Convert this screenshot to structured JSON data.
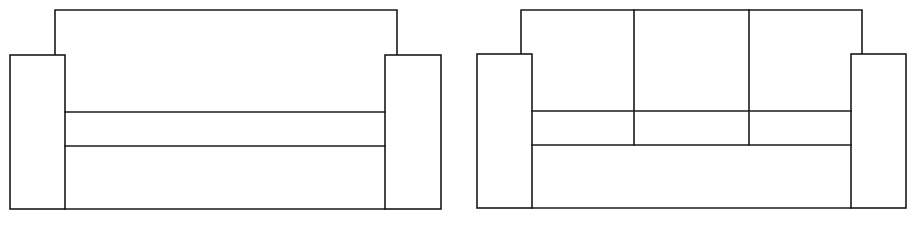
{
  "diagram": {
    "type": "furniture-line-drawing",
    "stroke_color": "#1a1a1a",
    "background_color": "#ffffff",
    "figures": [
      {
        "name": "sofa-single-cushion",
        "back": {
          "x1": 55,
          "x2": 397,
          "top": 10
        },
        "left_arm": {
          "x1": 10,
          "x2": 65,
          "top": 55,
          "bottom": 209
        },
        "right_arm": {
          "x1": 385,
          "x2": 441,
          "top": 55,
          "bottom": 209
        },
        "seat_lines_y": [
          112,
          146
        ],
        "cushion_dividers_x": []
      },
      {
        "name": "sofa-three-cushion",
        "back": {
          "x1": 521,
          "x2": 862,
          "top": 10
        },
        "left_arm": {
          "x1": 477,
          "x2": 532,
          "top": 54,
          "bottom": 208
        },
        "right_arm": {
          "x1": 851,
          "x2": 906,
          "top": 54,
          "bottom": 208
        },
        "seat_lines_y": [
          111,
          145
        ],
        "cushion_dividers_x": [
          634,
          749
        ]
      }
    ]
  }
}
